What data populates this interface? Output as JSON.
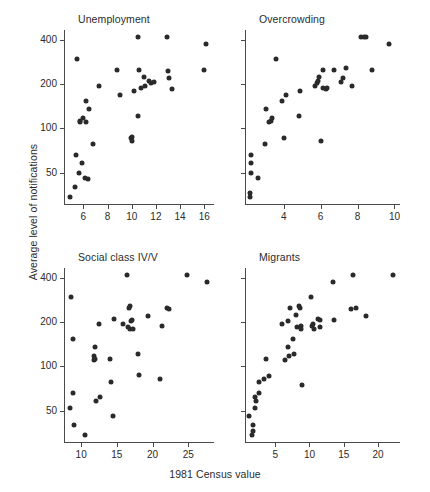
{
  "figure": {
    "ylabel": "Average level of notifications",
    "xlabel": "1981 Census value"
  },
  "chart_data": [
    {
      "type": "scatter",
      "title": "Unemployment",
      "xlabel": "1981 Census value",
      "ylabel": "Average level of notifications",
      "yscale": "log",
      "ylim": [
        30,
        470
      ],
      "yticks": [
        50,
        100,
        200,
        400
      ],
      "xlim": [
        4.4,
        16.8
      ],
      "xticks": [
        6,
        8,
        10,
        12,
        14,
        16
      ],
      "grid": false,
      "legend": "none",
      "points": [
        {
          "x": 4.9,
          "y": 34
        },
        {
          "x": 5.3,
          "y": 40
        },
        {
          "x": 5.4,
          "y": 66
        },
        {
          "x": 5.5,
          "y": 300
        },
        {
          "x": 5.6,
          "y": 50
        },
        {
          "x": 5.7,
          "y": 110
        },
        {
          "x": 5.75,
          "y": 112
        },
        {
          "x": 5.9,
          "y": 58
        },
        {
          "x": 6.0,
          "y": 118
        },
        {
          "x": 6.1,
          "y": 46
        },
        {
          "x": 6.2,
          "y": 155
        },
        {
          "x": 6.25,
          "y": 110
        },
        {
          "x": 6.4,
          "y": 45
        },
        {
          "x": 6.5,
          "y": 135
        },
        {
          "x": 6.8,
          "y": 78
        },
        {
          "x": 7.3,
          "y": 196
        },
        {
          "x": 8.8,
          "y": 250
        },
        {
          "x": 9.0,
          "y": 170
        },
        {
          "x": 9.9,
          "y": 86
        },
        {
          "x": 10.0,
          "y": 82
        },
        {
          "x": 10.05,
          "y": 88
        },
        {
          "x": 10.2,
          "y": 180
        },
        {
          "x": 10.5,
          "y": 420
        },
        {
          "x": 10.5,
          "y": 122
        },
        {
          "x": 10.6,
          "y": 250
        },
        {
          "x": 10.8,
          "y": 188
        },
        {
          "x": 11.0,
          "y": 225
        },
        {
          "x": 11.1,
          "y": 196
        },
        {
          "x": 11.4,
          "y": 210
        },
        {
          "x": 11.6,
          "y": 205
        },
        {
          "x": 11.8,
          "y": 208
        },
        {
          "x": 12.9,
          "y": 420
        },
        {
          "x": 13.0,
          "y": 245
        },
        {
          "x": 13.1,
          "y": 220
        },
        {
          "x": 13.3,
          "y": 186
        },
        {
          "x": 16.0,
          "y": 250
        },
        {
          "x": 16.1,
          "y": 375
        }
      ]
    },
    {
      "type": "scatter",
      "title": "Overcrowding",
      "xlabel": "1981 Census value",
      "ylabel": "Average level of notifications",
      "yscale": "log",
      "ylim": [
        30,
        470
      ],
      "yticks": [
        50,
        100,
        200,
        400
      ],
      "xlim": [
        1.9,
        10.3
      ],
      "xticks": [
        4,
        6,
        8,
        10
      ],
      "grid": false,
      "legend": "none",
      "points": [
        {
          "x": 2.15,
          "y": 34
        },
        {
          "x": 2.15,
          "y": 36
        },
        {
          "x": 2.2,
          "y": 50
        },
        {
          "x": 2.2,
          "y": 58
        },
        {
          "x": 2.25,
          "y": 66
        },
        {
          "x": 2.6,
          "y": 46
        },
        {
          "x": 3.0,
          "y": 78
        },
        {
          "x": 3.05,
          "y": 135
        },
        {
          "x": 3.2,
          "y": 110
        },
        {
          "x": 3.3,
          "y": 112
        },
        {
          "x": 3.35,
          "y": 118
        },
        {
          "x": 3.6,
          "y": 300
        },
        {
          "x": 3.9,
          "y": 155
        },
        {
          "x": 4.0,
          "y": 86
        },
        {
          "x": 4.1,
          "y": 170
        },
        {
          "x": 4.8,
          "y": 122
        },
        {
          "x": 4.9,
          "y": 180
        },
        {
          "x": 5.7,
          "y": 196
        },
        {
          "x": 5.8,
          "y": 205
        },
        {
          "x": 5.85,
          "y": 210
        },
        {
          "x": 5.9,
          "y": 225
        },
        {
          "x": 6.0,
          "y": 82
        },
        {
          "x": 6.1,
          "y": 250
        },
        {
          "x": 6.15,
          "y": 188
        },
        {
          "x": 6.3,
          "y": 186
        },
        {
          "x": 6.35,
          "y": 190
        },
        {
          "x": 6.7,
          "y": 250
        },
        {
          "x": 7.1,
          "y": 208
        },
        {
          "x": 7.2,
          "y": 220
        },
        {
          "x": 7.35,
          "y": 260
        },
        {
          "x": 7.7,
          "y": 196
        },
        {
          "x": 8.2,
          "y": 420
        },
        {
          "x": 8.35,
          "y": 420
        },
        {
          "x": 8.45,
          "y": 420
        },
        {
          "x": 8.8,
          "y": 250
        },
        {
          "x": 9.7,
          "y": 375
        }
      ]
    },
    {
      "type": "scatter",
      "title": "Social class IV/V",
      "xlabel": "1981 Census value",
      "ylabel": "Average level of notifications",
      "yscale": "log",
      "ylim": [
        30,
        470
      ],
      "yticks": [
        50,
        100,
        200,
        400
      ],
      "xlim": [
        7.6,
        28.6
      ],
      "xticks": [
        10,
        15,
        20,
        25
      ],
      "grid": false,
      "legend": "none",
      "points": [
        {
          "x": 8.4,
          "y": 52
        },
        {
          "x": 8.6,
          "y": 300
        },
        {
          "x": 8.8,
          "y": 66
        },
        {
          "x": 8.9,
          "y": 155
        },
        {
          "x": 9.0,
          "y": 40
        },
        {
          "x": 10.5,
          "y": 34
        },
        {
          "x": 11.8,
          "y": 110
        },
        {
          "x": 11.85,
          "y": 118
        },
        {
          "x": 11.9,
          "y": 112
        },
        {
          "x": 12.0,
          "y": 135
        },
        {
          "x": 12.1,
          "y": 58
        },
        {
          "x": 12.5,
          "y": 196
        },
        {
          "x": 12.6,
          "y": 62
        },
        {
          "x": 14.0,
          "y": 112
        },
        {
          "x": 14.2,
          "y": 78
        },
        {
          "x": 14.4,
          "y": 46
        },
        {
          "x": 14.6,
          "y": 210
        },
        {
          "x": 15.8,
          "y": 196
        },
        {
          "x": 16.4,
          "y": 420
        },
        {
          "x": 16.6,
          "y": 186
        },
        {
          "x": 16.7,
          "y": 250
        },
        {
          "x": 16.8,
          "y": 180
        },
        {
          "x": 16.9,
          "y": 260
        },
        {
          "x": 17.0,
          "y": 205
        },
        {
          "x": 17.1,
          "y": 208
        },
        {
          "x": 17.3,
          "y": 180
        },
        {
          "x": 18.0,
          "y": 122
        },
        {
          "x": 18.1,
          "y": 88
        },
        {
          "x": 19.4,
          "y": 220
        },
        {
          "x": 21.0,
          "y": 82
        },
        {
          "x": 21.3,
          "y": 188
        },
        {
          "x": 22.0,
          "y": 250
        },
        {
          "x": 22.3,
          "y": 245
        },
        {
          "x": 24.8,
          "y": 420
        },
        {
          "x": 27.6,
          "y": 375
        }
      ]
    },
    {
      "type": "scatter",
      "title": "Migrants",
      "xlabel": "1981 Census value",
      "ylabel": "Average level of notifications",
      "yscale": "log",
      "ylim": [
        30,
        470
      ],
      "yticks": [
        50,
        100,
        200,
        400
      ],
      "xlim": [
        0.6,
        23.2
      ],
      "xticks": [
        5,
        10,
        15,
        20
      ],
      "grid": false,
      "legend": "none",
      "points": [
        {
          "x": 1.2,
          "y": 46
        },
        {
          "x": 1.6,
          "y": 34
        },
        {
          "x": 1.7,
          "y": 36
        },
        {
          "x": 1.75,
          "y": 40
        },
        {
          "x": 2.0,
          "y": 52
        },
        {
          "x": 2.1,
          "y": 62
        },
        {
          "x": 2.2,
          "y": 58
        },
        {
          "x": 2.6,
          "y": 66
        },
        {
          "x": 2.7,
          "y": 78
        },
        {
          "x": 3.3,
          "y": 82
        },
        {
          "x": 3.6,
          "y": 112
        },
        {
          "x": 4.1,
          "y": 86
        },
        {
          "x": 6.0,
          "y": 196
        },
        {
          "x": 6.5,
          "y": 110
        },
        {
          "x": 6.8,
          "y": 135
        },
        {
          "x": 6.9,
          "y": 205
        },
        {
          "x": 7.0,
          "y": 118
        },
        {
          "x": 7.2,
          "y": 250
        },
        {
          "x": 7.6,
          "y": 155
        },
        {
          "x": 7.8,
          "y": 122
        },
        {
          "x": 8.0,
          "y": 225
        },
        {
          "x": 8.2,
          "y": 186
        },
        {
          "x": 8.5,
          "y": 260
        },
        {
          "x": 8.6,
          "y": 250
        },
        {
          "x": 8.7,
          "y": 180
        },
        {
          "x": 8.8,
          "y": 188
        },
        {
          "x": 8.9,
          "y": 75
        },
        {
          "x": 10.2,
          "y": 300
        },
        {
          "x": 10.4,
          "y": 190
        },
        {
          "x": 10.5,
          "y": 196
        },
        {
          "x": 10.6,
          "y": 180
        },
        {
          "x": 11.3,
          "y": 210
        },
        {
          "x": 11.5,
          "y": 208
        },
        {
          "x": 11.6,
          "y": 186
        },
        {
          "x": 13.4,
          "y": 375
        },
        {
          "x": 13.6,
          "y": 208
        },
        {
          "x": 16.3,
          "y": 420
        },
        {
          "x": 16.0,
          "y": 245
        },
        {
          "x": 16.8,
          "y": 250
        },
        {
          "x": 18.3,
          "y": 220
        },
        {
          "x": 22.2,
          "y": 420
        }
      ]
    }
  ]
}
